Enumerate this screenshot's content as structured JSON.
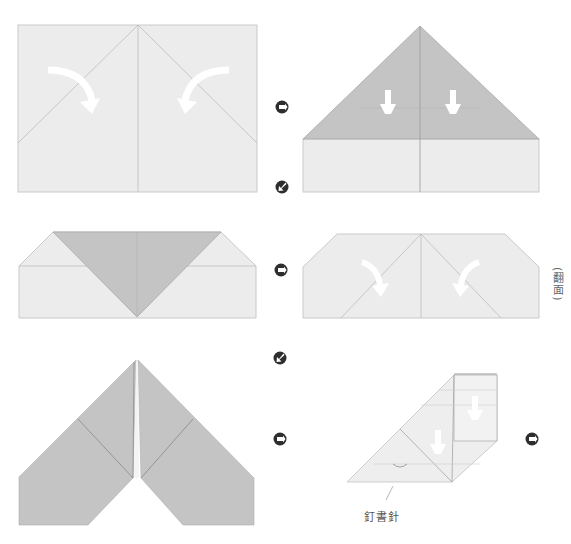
{
  "diagram": {
    "title": "",
    "colors": {
      "paper_light": "#ececec",
      "paper_dark": "#c4c4c4",
      "crease": "#b8b8b8",
      "edge": "#a8a8a8",
      "arrow": "#ffffff",
      "icon": "#2e2e2e",
      "background": "#ffffff"
    },
    "steps": [
      {
        "id": 1,
        "description": "Rectangle with center crease; fold top corners down to center along diagonals",
        "arrows": [
          "curved-right-down",
          "curved-left-down"
        ]
      },
      {
        "id": 2,
        "description": "Triangle top folded; fold triangle down",
        "arrows": [
          "down",
          "down"
        ]
      },
      {
        "id": 3,
        "description": "Triangle folded down forming V over rectangle"
      },
      {
        "id": 4,
        "description": "Pentagon-like shape with diagonal creases; fold corners to center",
        "arrows": [
          "curved-right-down",
          "curved-left-down"
        ],
        "note": "(翻面)"
      },
      {
        "id": 5,
        "description": "Paper airplane V shape with wings"
      },
      {
        "id": 6,
        "description": "Folded side view with staple",
        "arrows": [
          "down",
          "down"
        ],
        "label": "釘書針"
      }
    ],
    "icons": [
      {
        "name": "next-step-icon",
        "position": "after step 1"
      },
      {
        "name": "next-row-icon",
        "position": "below step 2"
      },
      {
        "name": "next-step-icon",
        "position": "after step 3"
      },
      {
        "name": "next-row-icon",
        "position": "below step 4"
      },
      {
        "name": "next-step-icon",
        "position": "after step 5"
      },
      {
        "name": "next-step-icon",
        "position": "after step 6"
      }
    ],
    "labels": {
      "flip_over": "(翻面)",
      "staple": "釘書針"
    }
  }
}
